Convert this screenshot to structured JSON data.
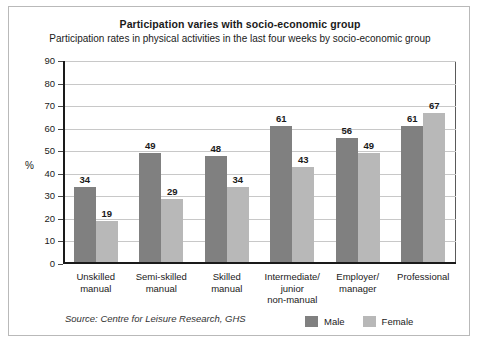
{
  "chart_data": {
    "type": "bar",
    "title": "Participation varies with socio-economic group",
    "subtitle": "Participation rates in physical activities in the last four weeks by socio-economic group",
    "xlabel": "",
    "ylabel": "%",
    "ylim": [
      0,
      90
    ],
    "ytick_step": 10,
    "yticks": [
      "90",
      "80",
      "70",
      "60",
      "50",
      "40",
      "30",
      "20",
      "10",
      "0"
    ],
    "grid": true,
    "legend_position": "bottom-right",
    "categories": [
      "Unskilled\nmanual",
      "Semi-skilled\nmanual",
      "Skilled\nmanual",
      "Intermediate/\njunior\nnon-manual",
      "Employer/\nmanager",
      "Professional"
    ],
    "series": [
      {
        "name": "Male",
        "color": "#808080",
        "values": [
          34,
          49,
          48,
          61,
          56,
          61
        ]
      },
      {
        "name": "Female",
        "color": "#b8b8b8",
        "values": [
          19,
          29,
          34,
          43,
          49,
          67
        ]
      }
    ],
    "source": "Source: Centre for Leisure Research, GHS"
  }
}
